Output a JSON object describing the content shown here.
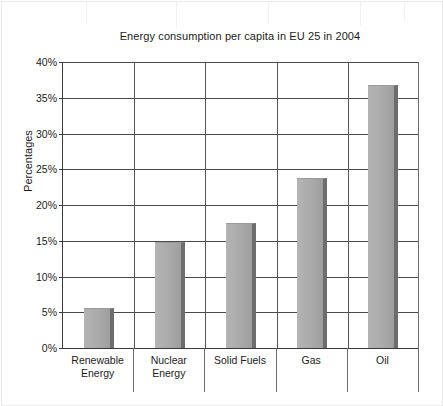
{
  "chart_data": {
    "type": "bar",
    "title": "Energy consumption per capita in EU 25 in 2004",
    "xlabel": "",
    "ylabel": "Percentages",
    "categories": [
      "Renewable Energy",
      "Nuclear Energy",
      "Solid Fuels",
      "Gas",
      "Oil"
    ],
    "values": [
      5.6,
      14.8,
      17.5,
      23.8,
      36.8
    ],
    "ylim": [
      0,
      40
    ],
    "ytick_values": [
      0,
      5,
      10,
      15,
      20,
      25,
      30,
      35,
      40
    ],
    "ytick_labels": [
      "0%",
      "5%",
      "10%",
      "15%",
      "20%",
      "25%",
      "30%",
      "35%",
      "40%"
    ],
    "grid": true,
    "legend": false,
    "bar_color": "#aaaaaa",
    "bar_edge_color": "#6d6d6d",
    "axis_color": "#3a3a3a",
    "background_color": "#ffffff"
  },
  "axis": {
    "y_title": "Percentages",
    "ticks": [
      {
        "label": "40%",
        "value": 40
      },
      {
        "label": "35%",
        "value": 35
      },
      {
        "label": "30%",
        "value": 30
      },
      {
        "label": "25%",
        "value": 25
      },
      {
        "label": "20%",
        "value": 20
      },
      {
        "label": "15%",
        "value": 15
      },
      {
        "label": "10%",
        "value": 10
      },
      {
        "label": "5%",
        "value": 5
      },
      {
        "label": "0%",
        "value": 0
      }
    ]
  },
  "categories": [
    {
      "line1": "Renewable",
      "line2": "Energy",
      "full": "Renewable Energy",
      "value": 5.6
    },
    {
      "line1": "Nuclear",
      "line2": "Energy",
      "full": "Nuclear Energy",
      "value": 14.8
    },
    {
      "line1": "Solid Fuels",
      "line2": "",
      "full": "Solid Fuels",
      "value": 17.5
    },
    {
      "line1": "Gas",
      "line2": "",
      "full": "Gas",
      "value": 23.8
    },
    {
      "line1": "Oil",
      "line2": "",
      "full": "Oil",
      "value": 36.8
    }
  ]
}
